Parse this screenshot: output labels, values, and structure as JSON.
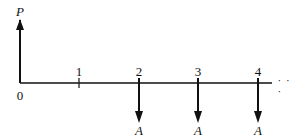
{
  "diagram": {
    "type": "cash-flow-diagram",
    "axis": {
      "origin_label": "0",
      "continuation": "· · ·"
    },
    "upward_flow": {
      "label": "P",
      "period": 0
    },
    "periods": [
      {
        "label": "1",
        "flow": null
      },
      {
        "label": "2",
        "flow": "A"
      },
      {
        "label": "3",
        "flow": "A"
      },
      {
        "label": "4",
        "flow": "A"
      }
    ],
    "colors": {
      "line": "#111111"
    }
  }
}
